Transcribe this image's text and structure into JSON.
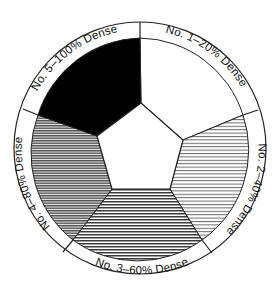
{
  "diagram": {
    "title": "",
    "type": "density-wheel",
    "segments": [
      {
        "id": "no1",
        "label": "No. 1–20% Dense",
        "number": 1,
        "density_percent": 20,
        "fill": "white",
        "color": "#ffffff"
      },
      {
        "id": "no2",
        "label": "No. 2–40% Dense",
        "number": 2,
        "density_percent": 40,
        "fill": "light-hatch",
        "color": "#9a9a9a"
      },
      {
        "id": "no3",
        "label": "No. 3–60% Dense",
        "number": 3,
        "density_percent": 60,
        "fill": "medium-hatch",
        "color": "#555555"
      },
      {
        "id": "no4",
        "label": "No. 4–80% Dense",
        "number": 4,
        "density_percent": 80,
        "fill": "dense-hatch",
        "color": "#444444"
      },
      {
        "id": "no5",
        "label": "No. 5–100% Dense",
        "number": 5,
        "density_percent": 100,
        "fill": "solid",
        "color": "#000000"
      }
    ],
    "center": {
      "shape": "pentagon",
      "fill": "#ffffff"
    }
  }
}
